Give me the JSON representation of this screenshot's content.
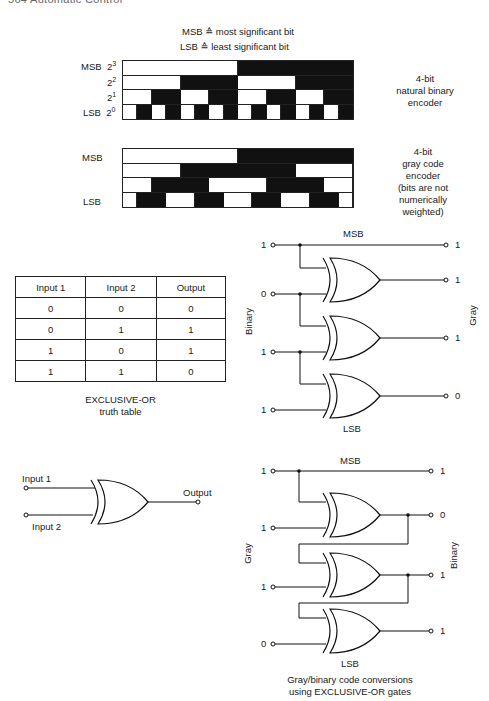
{
  "page_header": "564   Automatic Control",
  "legend": {
    "msb_line": "MSB ≙ most significant bit",
    "lsb_line": "LSB ≙ least significant bit"
  },
  "binary_encoder": {
    "row_labels": [
      {
        "name": "MSB",
        "power": "2",
        "exp": "3"
      },
      {
        "name": "",
        "power": "2",
        "exp": "2"
      },
      {
        "name": "",
        "power": "2",
        "exp": "1"
      },
      {
        "name": "LSB",
        "power": "2",
        "exp": "0"
      }
    ],
    "caption_lines": [
      "4-bit",
      "natural binary",
      "encoder"
    ],
    "rows": [
      [
        0,
        0,
        0,
        0,
        0,
        0,
        0,
        0,
        1,
        1,
        1,
        1,
        1,
        1,
        1,
        1
      ],
      [
        0,
        0,
        0,
        0,
        1,
        1,
        1,
        1,
        0,
        0,
        0,
        0,
        1,
        1,
        1,
        1
      ],
      [
        0,
        0,
        1,
        1,
        0,
        0,
        1,
        1,
        0,
        0,
        1,
        1,
        0,
        0,
        1,
        1
      ],
      [
        0,
        1,
        0,
        1,
        0,
        1,
        0,
        1,
        0,
        1,
        0,
        1,
        0,
        1,
        0,
        1
      ]
    ]
  },
  "gray_encoder": {
    "row_labels": [
      "MSB",
      "",
      "",
      "LSB"
    ],
    "caption_lines": [
      "4-bit",
      "gray code",
      "encoder",
      "(bits are not",
      "numerically",
      "weighted)"
    ],
    "rows": [
      [
        0,
        0,
        0,
        0,
        0,
        0,
        0,
        0,
        1,
        1,
        1,
        1,
        1,
        1,
        1,
        1
      ],
      [
        0,
        0,
        0,
        0,
        1,
        1,
        1,
        1,
        1,
        1,
        1,
        1,
        0,
        0,
        0,
        0
      ],
      [
        0,
        0,
        1,
        1,
        1,
        1,
        0,
        0,
        0,
        0,
        1,
        1,
        1,
        1,
        0,
        0
      ],
      [
        0,
        1,
        1,
        0,
        0,
        1,
        1,
        0,
        0,
        1,
        1,
        0,
        0,
        1,
        1,
        0
      ]
    ]
  },
  "truth_table": {
    "headers": [
      "Input 1",
      "Input 2",
      "Output"
    ],
    "rows": [
      [
        "0",
        "0",
        "0"
      ],
      [
        "0",
        "1",
        "1"
      ],
      [
        "1",
        "0",
        "1"
      ],
      [
        "1",
        "1",
        "0"
      ]
    ],
    "caption_lines": [
      "EXCLUSIVE-OR",
      "truth table"
    ]
  },
  "xor_gate_symbol": {
    "input1": "Input 1",
    "input2": "Input 2",
    "output": "Output"
  },
  "binary_to_gray": {
    "top_label": "MSB",
    "bottom_label": "LSB",
    "left_axis": "Binary",
    "right_axis": "Gray",
    "inputs": [
      "1",
      "0",
      "1",
      "1"
    ],
    "outputs": [
      "1",
      "1",
      "1",
      "0"
    ]
  },
  "gray_to_binary": {
    "top_label": "MSB",
    "bottom_label": "LSB",
    "left_axis": "Gray",
    "right_axis": "Binary",
    "inputs": [
      "1",
      "1",
      "1",
      "0"
    ],
    "outputs": [
      "1",
      "0",
      "1",
      "1"
    ],
    "caption_lines": [
      "Gray/binary code conversions",
      "using EXCLUSIVE-OR gates"
    ]
  },
  "colors": {
    "ink": "#111111",
    "paper": "#ffffff"
  }
}
